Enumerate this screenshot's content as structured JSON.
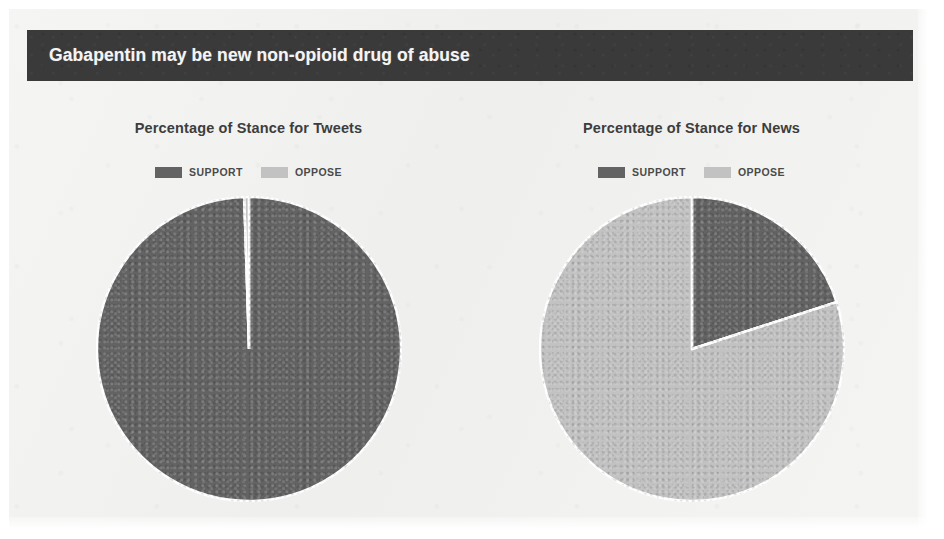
{
  "banner": {
    "title": "Gabapentin may be new non-opioid drug of abuse"
  },
  "legend": {
    "support_label": "SUPPORT",
    "oppose_label": "OPPOSE"
  },
  "colors": {
    "support": "#636363",
    "oppose": "#c2c2c2",
    "banner_background": "#3a3a3a",
    "banner_text": "#f4f4f4",
    "page_background": "#f2f2f0",
    "slice_separator": "#ffffff"
  },
  "chart_data": [
    {
      "type": "pie",
      "title": "Percentage of Stance for Tweets",
      "labels": [
        "SUPPORT",
        "OPPOSE"
      ],
      "values": [
        99.5,
        0.5
      ],
      "colors": [
        "#636363",
        "#c2c2c2"
      ],
      "start_angle_deg": 0,
      "direction": "clockwise",
      "legend_position": "top",
      "xlabel": "",
      "ylabel": ""
    },
    {
      "type": "pie",
      "title": "Percentage of Stance for News",
      "labels": [
        "SUPPORT",
        "OPPOSE"
      ],
      "values": [
        20,
        80
      ],
      "colors": [
        "#636363",
        "#c2c2c2"
      ],
      "start_angle_deg": 0,
      "direction": "clockwise",
      "legend_position": "top",
      "xlabel": "",
      "ylabel": ""
    }
  ]
}
